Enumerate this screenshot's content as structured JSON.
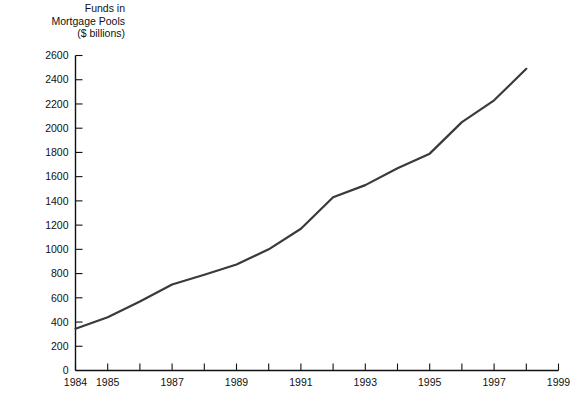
{
  "chart_data": {
    "type": "line",
    "title": "Funds in\nMortgage Pools\n($ billions)",
    "title_lines": [
      "Funds in",
      "Mortgage Pools",
      "($ billions)"
    ],
    "xlabel": "",
    "ylabel": "Funds in Mortgage Pools ($ billions)",
    "xlim": [
      1984,
      1999
    ],
    "ylim": [
      0,
      2600
    ],
    "grid": false,
    "legend": "none",
    "line_color": "#3a3a3a",
    "x": [
      1984,
      1985,
      1986,
      1987,
      1988,
      1989,
      1990,
      1991,
      1992,
      1993,
      1994,
      1995,
      1996,
      1997,
      1998
    ],
    "values": [
      345,
      440,
      570,
      710,
      790,
      875,
      1000,
      1170,
      1430,
      1530,
      1670,
      1790,
      2050,
      2230,
      2490
    ],
    "series": [
      {
        "name": "Funds in Mortgage Pools",
        "values": [
          345,
          440,
          570,
          710,
          790,
          875,
          1000,
          1170,
          1430,
          1530,
          1670,
          1790,
          2050,
          2230,
          2490
        ]
      }
    ],
    "y_ticks": [
      0,
      200,
      400,
      600,
      800,
      1000,
      1200,
      1400,
      1600,
      1800,
      2000,
      2200,
      2400,
      2600
    ],
    "y_tick_labels": [
      "0",
      "200",
      "400",
      "600",
      "800",
      "1000",
      "1200",
      "1400",
      "1600",
      "1800",
      "2000",
      "2200",
      "2400",
      "2600"
    ],
    "x_ticks": [
      1984,
      1985,
      1986,
      1987,
      1988,
      1989,
      1990,
      1991,
      1992,
      1993,
      1994,
      1995,
      1996,
      1997,
      1998,
      1999
    ],
    "x_tick_labels": [
      "1984",
      "1985",
      "",
      "1987",
      "",
      "1989",
      "",
      "1991",
      "",
      "1993",
      "",
      "1995",
      "",
      "1997",
      "",
      "1999"
    ]
  }
}
